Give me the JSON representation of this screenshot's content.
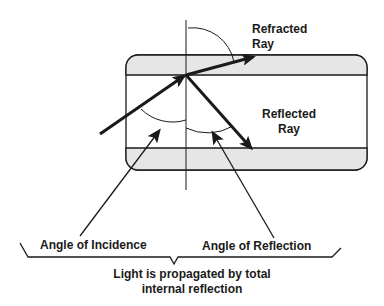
{
  "diagram": {
    "labels": {
      "refracted_ray": [
        "Refracted",
        "Ray"
      ],
      "reflected_ray": [
        "Reflected",
        "Ray"
      ],
      "angle_of_incidence": "Angle of Incidence",
      "angle_of_reflection": "Angle of Reflection",
      "caption": [
        "Light is propagated by total",
        "internal reflection"
      ]
    },
    "colors": {
      "cladding_fill": "#e6e6e6",
      "line": "#1a1a1a",
      "background": "#ffffff"
    }
  }
}
